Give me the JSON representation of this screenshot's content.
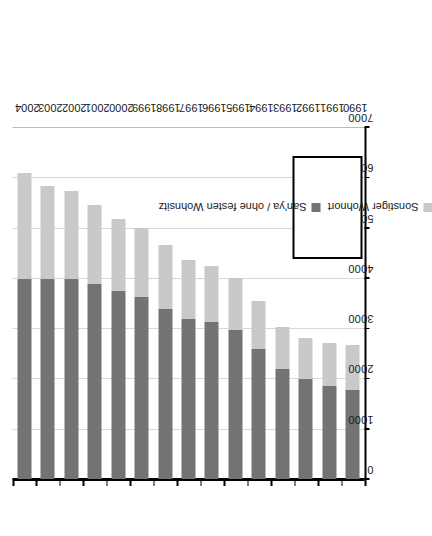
{
  "chart_data": {
    "type": "bar",
    "orientation": "horizontal-stacked",
    "title": "",
    "subtitle": "",
    "xlabel": "",
    "ylabel": "",
    "categories": [
      "1990",
      "1991",
      "1992",
      "1993",
      "1994",
      "1995",
      "1996",
      "1997",
      "1998",
      "1999",
      "2000",
      "2001",
      "2002",
      "2003",
      "2004"
    ],
    "series": [
      {
        "name": "San'ya / ohne festen Wohnsitz",
        "color": "#737373",
        "values": [
          1780,
          1870,
          2000,
          2200,
          2600,
          2980,
          3140,
          3200,
          3400,
          3640,
          3760,
          3900,
          4000,
          4000,
          4000
        ]
      },
      {
        "name": "Sonstiger Wohnort",
        "color": "#c9c9c9",
        "values": [
          900,
          850,
          820,
          840,
          960,
          1040,
          1120,
          1180,
          1270,
          1370,
          1440,
          1570,
          1750,
          1840,
          2100
        ]
      }
    ],
    "totals": [
      2680,
      2720,
      2820,
      3040,
      3560,
      4020,
      4260,
      4380,
      4670,
      5010,
      5200,
      5470,
      5750,
      5840,
      6100
    ],
    "value_axis": {
      "min": 0,
      "max": 7000,
      "tick_step": 1000,
      "ticks": [
        "7000",
        "6000",
        "5000",
        "4000",
        "3000",
        "2000",
        "1000",
        "0"
      ],
      "tick_values": [
        7000,
        6000,
        5000,
        4000,
        3000,
        2000,
        1000,
        0
      ],
      "direction": "right-to-left"
    },
    "grid": true,
    "legend": {
      "position": "bottom-left",
      "bordered": true,
      "entries": [
        {
          "label": "Sonstiger Wohnort",
          "color": "#c9c9c9"
        },
        {
          "label": "San'ya / ohne festen Wohnsitz",
          "color": "#737373"
        }
      ]
    }
  },
  "legend": {
    "entry_0_label": "Sonstiger Wohnort",
    "entry_1_label": "San'ya / ohne festen Wohnsitz"
  },
  "colors": {
    "series_light": "#c9c9c9",
    "series_dark": "#737373",
    "grid": "#d8d8d8",
    "axis": "#000000",
    "background": "#ffffff"
  }
}
